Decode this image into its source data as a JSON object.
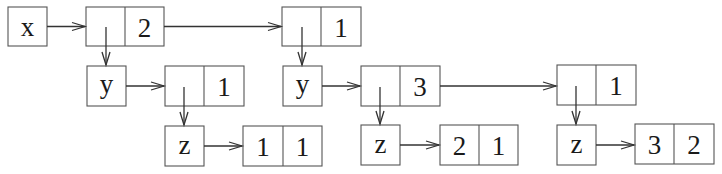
{
  "diagram": {
    "type": "nested-list-structure",
    "nodes": {
      "sym_x": {
        "label": "x",
        "kind": "symbol",
        "box": [
          8,
          7,
          39,
          39
        ]
      },
      "cell_a": {
        "left": "",
        "right": "2",
        "kind": "cons",
        "box": [
          86,
          7,
          78,
          39
        ]
      },
      "cell_b": {
        "left": "",
        "right": "1",
        "kind": "cons",
        "box": [
          282,
          7,
          79,
          39
        ]
      },
      "sym_y1": {
        "label": "y",
        "kind": "symbol",
        "box": [
          87,
          66,
          39,
          40
        ]
      },
      "cell_c": {
        "left": "",
        "right": "1",
        "kind": "cons",
        "box": [
          165,
          66,
          79,
          40
        ]
      },
      "sym_y2": {
        "label": "y",
        "kind": "symbol",
        "box": [
          283,
          66,
          39,
          40
        ]
      },
      "cell_d": {
        "left": "",
        "right": "3",
        "kind": "cons",
        "box": [
          361,
          66,
          79,
          40
        ]
      },
      "cell_e": {
        "left": "",
        "right": "1",
        "kind": "cons",
        "box": [
          557,
          65,
          79,
          40
        ]
      },
      "sym_z1": {
        "label": "z",
        "kind": "symbol",
        "box": [
          165,
          126,
          39,
          40
        ]
      },
      "cell_f": {
        "left": "1",
        "right": "1",
        "kind": "cons",
        "box": [
          243,
          126,
          79,
          40
        ]
      },
      "sym_z2": {
        "label": "z",
        "kind": "symbol",
        "box": [
          361,
          125,
          39,
          40
        ]
      },
      "cell_g": {
        "left": "2",
        "right": "1",
        "kind": "cons",
        "box": [
          440,
          125,
          78,
          40
        ]
      },
      "sym_z3": {
        "label": "z",
        "kind": "symbol",
        "box": [
          557,
          125,
          39,
          40
        ]
      },
      "cell_h": {
        "left": "3",
        "right": "2",
        "kind": "cons",
        "box": [
          635,
          124,
          79,
          40
        ]
      }
    },
    "edges": [
      {
        "from": "sym_x",
        "to": "cell_a",
        "dir": "right"
      },
      {
        "from": "cell_a",
        "to": "cell_b",
        "dir": "right"
      },
      {
        "from": "cell_a",
        "to": "sym_y1",
        "dir": "down"
      },
      {
        "from": "cell_b",
        "to": "sym_y2",
        "dir": "down"
      },
      {
        "from": "sym_y1",
        "to": "cell_c",
        "dir": "right"
      },
      {
        "from": "cell_c",
        "to": "sym_z1",
        "dir": "down"
      },
      {
        "from": "sym_z1",
        "to": "cell_f",
        "dir": "right"
      },
      {
        "from": "sym_y2",
        "to": "cell_d",
        "dir": "right"
      },
      {
        "from": "cell_d",
        "to": "cell_e",
        "dir": "right"
      },
      {
        "from": "cell_d",
        "to": "sym_z2",
        "dir": "down"
      },
      {
        "from": "sym_z2",
        "to": "cell_g",
        "dir": "right"
      },
      {
        "from": "cell_e",
        "to": "sym_z3",
        "dir": "down"
      },
      {
        "from": "sym_z3",
        "to": "cell_h",
        "dir": "right"
      }
    ]
  }
}
